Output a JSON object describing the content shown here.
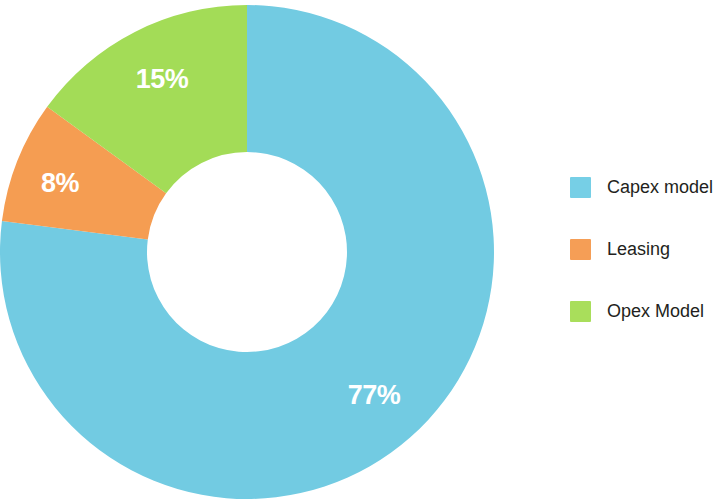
{
  "chart_data": {
    "type": "pie",
    "variant": "donut",
    "title": "",
    "subtitle": "",
    "xlabel": "",
    "ylabel": "",
    "grid": false,
    "legend_position": "right",
    "units": "percent",
    "start_angle_deg": 0,
    "direction": "clockwise",
    "inner_radius_ratio": 0.405,
    "categories": [
      "Capex model",
      "Leasing",
      "Opex Model"
    ],
    "values": [
      77,
      8,
      15
    ],
    "labels": [
      "77%",
      "8%",
      "15%"
    ],
    "colors": [
      "#72CBE2",
      "#F59D52",
      "#A3DC57"
    ],
    "slices": [
      {
        "name": "Capex model",
        "value": 77,
        "label": "77%",
        "color": "#72CBE2",
        "start_deg": 0,
        "end_deg": 277.2,
        "label_x": 374,
        "label_y": 404
      },
      {
        "name": "Leasing",
        "value": 8,
        "label": "8%",
        "color": "#F59D52",
        "start_deg": 277.2,
        "end_deg": 306,
        "label_x": 60,
        "label_y": 192
      },
      {
        "name": "Opex Model",
        "value": 15,
        "label": "15%",
        "color": "#A3DC57",
        "start_deg": 306,
        "end_deg": 360,
        "label_x": 162,
        "label_y": 88
      }
    ]
  },
  "legend": {
    "items": [
      {
        "label": "Capex model",
        "color": "#76CFE6"
      },
      {
        "label": "Leasing",
        "color": "#F59E56"
      },
      {
        "label": "Opex Model",
        "color": "#A9DE5B"
      }
    ]
  },
  "geometry": {
    "center_x": 247,
    "center_y": 252,
    "outer_radius": 247,
    "inner_radius": 100
  }
}
